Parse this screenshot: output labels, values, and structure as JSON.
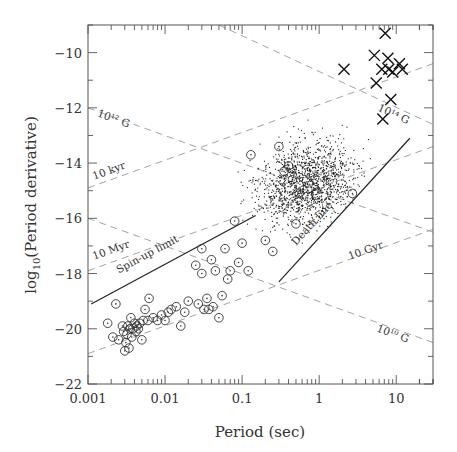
{
  "chart_data": {
    "type": "scatter",
    "title": "",
    "xlabel": "Period (sec)",
    "ylabel": "log10(Period derivative)",
    "xscale": "log",
    "xlim": [
      0.001,
      30
    ],
    "ylim": [
      -22,
      -9
    ],
    "xticks": [
      {
        "value": 0.001,
        "label": "0.001"
      },
      {
        "value": 0.01,
        "label": "0.01"
      },
      {
        "value": 0.1,
        "label": "0.1"
      },
      {
        "value": 1,
        "label": "1"
      },
      {
        "value": 10,
        "label": "10"
      }
    ],
    "yticks": [
      {
        "value": -10,
        "label": "−10"
      },
      {
        "value": -12,
        "label": "−12"
      },
      {
        "value": -14,
        "label": "−14"
      },
      {
        "value": -16,
        "label": "−16"
      },
      {
        "value": -18,
        "label": "−18"
      },
      {
        "value": -20,
        "label": "−20"
      },
      {
        "value": -22,
        "label": "−22"
      }
    ],
    "grid": false,
    "legend": null,
    "reference_lines": [
      {
        "name": "B = 10^12 G",
        "style": "dashed",
        "kind": "constant-B",
        "label": "10¹² G",
        "points": [
          [
            0.001,
            -12.0
          ],
          [
            30,
            -16.5
          ]
        ]
      },
      {
        "name": "B = 10^14 G",
        "style": "dashed",
        "kind": "constant-B",
        "label": "10¹⁴ G",
        "points": [
          [
            0.05,
            -9.0
          ],
          [
            30,
            -12.6
          ]
        ]
      },
      {
        "name": "B = 10^10 G",
        "style": "dashed",
        "kind": "constant-B",
        "label": "10¹⁰ G",
        "points": [
          [
            0.001,
            -16.0
          ],
          [
            30,
            -20.5
          ]
        ]
      },
      {
        "name": "tau = 10 kyr",
        "style": "dashed",
        "kind": "constant-age",
        "label": "10 kyr",
        "points": [
          [
            0.001,
            -14.9
          ],
          [
            30,
            -10.4
          ]
        ]
      },
      {
        "name": "tau = 10 Myr",
        "style": "dashed",
        "kind": "constant-age",
        "label": "10 Myr",
        "points": [
          [
            0.001,
            -17.9
          ],
          [
            30,
            -13.4
          ]
        ]
      },
      {
        "name": "tau = 10 Gyr",
        "style": "dashed",
        "kind": "constant-age",
        "label": "10 Gyr",
        "points": [
          [
            0.001,
            -20.9
          ],
          [
            30,
            -16.4
          ]
        ]
      },
      {
        "name": "Spin-up limit",
        "style": "solid",
        "label": "Spin-up limit",
        "points": [
          [
            0.0011,
            -19.1
          ],
          [
            0.15,
            -15.9
          ]
        ]
      },
      {
        "name": "Death line",
        "style": "solid",
        "label": "Death line",
        "points": [
          [
            0.3,
            -18.3
          ],
          [
            15,
            -13.1
          ]
        ]
      }
    ],
    "series": [
      {
        "name": "Radio pulsars (normal)",
        "marker": "dot",
        "description": "~1500 small dots clustered around P 0.1-3 s, log Pdot -17 to -12",
        "center": [
          0.7,
          -14.7
        ],
        "values_sample": [
          [
            0.3,
            -14.5
          ],
          [
            0.5,
            -15.0
          ],
          [
            0.7,
            -14.5
          ],
          [
            1.0,
            -15.2
          ],
          [
            1.5,
            -14.8
          ],
          [
            0.2,
            -15.5
          ],
          [
            0.4,
            -13.8
          ],
          [
            2.0,
            -14.0
          ],
          [
            1.0,
            -13.5
          ],
          [
            0.6,
            -16.0
          ]
        ]
      },
      {
        "name": "Binary / millisecond pulsars",
        "marker": "circle-dot",
        "values": [
          [
            0.0018,
            -19.8
          ],
          [
            0.0021,
            -20.3
          ],
          [
            0.0023,
            -19.1
          ],
          [
            0.0025,
            -20.4
          ],
          [
            0.0028,
            -19.9
          ],
          [
            0.0029,
            -20.1
          ],
          [
            0.003,
            -20.8
          ],
          [
            0.0031,
            -20.5
          ],
          [
            0.0032,
            -20.2
          ],
          [
            0.0033,
            -19.9
          ],
          [
            0.0034,
            -20.7
          ],
          [
            0.0035,
            -20.0
          ],
          [
            0.0036,
            -19.6
          ],
          [
            0.0037,
            -20.3
          ],
          [
            0.0038,
            -20.0
          ],
          [
            0.004,
            -19.8
          ],
          [
            0.0042,
            -20.1
          ],
          [
            0.0043,
            -19.9
          ],
          [
            0.0045,
            -20.0
          ],
          [
            0.0047,
            -19.8
          ],
          [
            0.005,
            -20.4
          ],
          [
            0.0052,
            -19.7
          ],
          [
            0.0055,
            -19.3
          ],
          [
            0.006,
            -19.7
          ],
          [
            0.0062,
            -18.9
          ],
          [
            0.007,
            -19.6
          ],
          [
            0.008,
            -19.7
          ],
          [
            0.009,
            -19.5
          ],
          [
            0.01,
            -19.7
          ],
          [
            0.011,
            -19.4
          ],
          [
            0.012,
            -19.3
          ],
          [
            0.014,
            -19.2
          ],
          [
            0.016,
            -19.9
          ],
          [
            0.018,
            -19.4
          ],
          [
            0.02,
            -19.0
          ],
          [
            0.025,
            -17.7
          ],
          [
            0.027,
            -19.1
          ],
          [
            0.03,
            -18.0
          ],
          [
            0.03,
            -17.1
          ],
          [
            0.032,
            -19.3
          ],
          [
            0.035,
            -18.9
          ],
          [
            0.037,
            -19.3
          ],
          [
            0.04,
            -17.5
          ],
          [
            0.042,
            -19.2
          ],
          [
            0.045,
            -17.9
          ],
          [
            0.05,
            -19.6
          ],
          [
            0.055,
            -18.8
          ],
          [
            0.06,
            -17.1
          ],
          [
            0.065,
            -18.2
          ],
          [
            0.07,
            -17.9
          ],
          [
            0.08,
            -16.1
          ],
          [
            0.09,
            -17.6
          ],
          [
            0.1,
            -16.9
          ],
          [
            0.12,
            -17.9
          ],
          [
            0.13,
            -13.7
          ],
          [
            0.2,
            -16.8
          ],
          [
            0.25,
            -17.2
          ],
          [
            0.3,
            -13.4
          ],
          [
            0.35,
            -14.3
          ],
          [
            0.4,
            -14.1
          ],
          [
            0.45,
            -14.6
          ],
          [
            0.5,
            -16.2
          ],
          [
            0.55,
            -15.1
          ],
          [
            2.7,
            -15.1
          ]
        ]
      },
      {
        "name": "Magnetars (AXPs/SGRs)",
        "marker": "x",
        "values": [
          [
            2.1,
            -10.6
          ],
          [
            5.2,
            -10.1
          ],
          [
            5.5,
            -11.1
          ],
          [
            6.5,
            -10.6
          ],
          [
            6.7,
            -12.4
          ],
          [
            7.2,
            -9.3
          ],
          [
            7.8,
            -10.2
          ],
          [
            8.0,
            -10.6
          ],
          [
            8.5,
            -11.7
          ],
          [
            9.0,
            -10.7
          ],
          [
            11.0,
            -10.4
          ],
          [
            12.0,
            -10.6
          ]
        ]
      }
    ],
    "annotations": [
      {
        "text": "10¹² G",
        "x": 0.0013,
        "y": -12.3
      },
      {
        "text": "10 kyr",
        "x": 0.0012,
        "y": -14.6
      },
      {
        "text": "10 Myr",
        "x": 0.0012,
        "y": -17.5
      },
      {
        "text": "Spin-up limit",
        "x": 0.0025,
        "y": -18.0
      },
      {
        "text": "Death line",
        "x": 0.5,
        "y": -17.0
      },
      {
        "text": "10 Gyr",
        "x": 2.5,
        "y": -17.5
      },
      {
        "text": "10¹⁴ G",
        "x": 14,
        "y": -12.6
      },
      {
        "text": "10¹⁰ G",
        "x": 14,
        "y": -20.5
      }
    ]
  }
}
